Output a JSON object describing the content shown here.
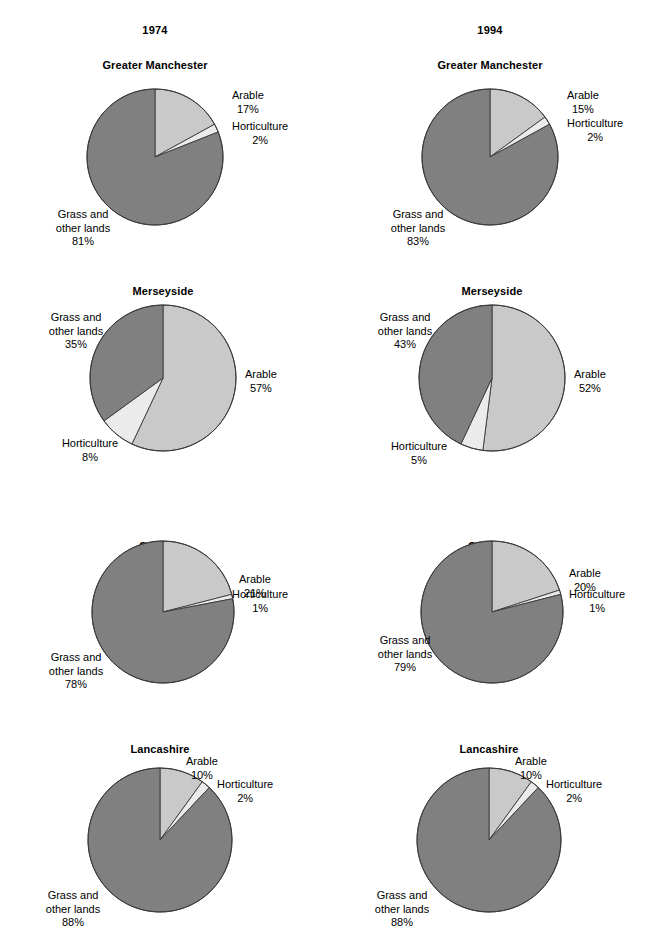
{
  "figure": {
    "columns": [
      {
        "year_label": "1974"
      },
      {
        "year_label": "1994"
      }
    ],
    "legend_colors": {
      "arable": "#c9c9c9",
      "horticulture": "#ebebeb",
      "grass": "#808080",
      "outline": "#3a3a3a"
    },
    "footnote": ""
  },
  "chart_data": {
    "type": "pie",
    "title": "",
    "categories": [
      "Arable",
      "Horticulture",
      "Grass and other lands"
    ],
    "legend": [
      "Arable",
      "Horticulture",
      "Grass and other lands"
    ],
    "colors": [
      "#c9c9c9",
      "#ebebeb",
      "#808080"
    ],
    "units": "%",
    "start_angle_deg": 0,
    "direction": "clockwise",
    "panels": [
      {
        "id": "gm-1974",
        "year": "1974",
        "county": "Greater Manchester",
        "slices": [
          {
            "label": "Arable",
            "value": 17,
            "value_label": "17%"
          },
          {
            "label": "Horticulture",
            "value": 2,
            "value_label": "2%"
          },
          {
            "label": "Grass and other lands",
            "value": 81,
            "value_label": "81%"
          }
        ]
      },
      {
        "id": "gm-1994",
        "year": "1994",
        "county": "Greater Manchester",
        "slices": [
          {
            "label": "Arable",
            "value": 15,
            "value_label": "15%"
          },
          {
            "label": "Horticulture",
            "value": 2,
            "value_label": "2%"
          },
          {
            "label": "Grass and other lands",
            "value": 83,
            "value_label": "83%"
          }
        ]
      },
      {
        "id": "mer-1974",
        "year": "1974",
        "county": "Merseyside",
        "slices": [
          {
            "label": "Arable",
            "value": 57,
            "value_label": "57%"
          },
          {
            "label": "Horticulture",
            "value": 8,
            "value_label": "8%"
          },
          {
            "label": "Grass and other lands",
            "value": 35,
            "value_label": "35%"
          }
        ]
      },
      {
        "id": "mer-1994",
        "year": "1994",
        "county": "Merseyside",
        "slices": [
          {
            "label": "Arable",
            "value": 52,
            "value_label": "52%"
          },
          {
            "label": "Horticulture",
            "value": 5,
            "value_label": "5%"
          },
          {
            "label": "Grass and other lands",
            "value": 43,
            "value_label": "43%"
          }
        ]
      },
      {
        "id": "che-1974",
        "year": "1974",
        "county": "Cheshire",
        "slices": [
          {
            "label": "Arable",
            "value": 21,
            "value_label": "21%"
          },
          {
            "label": "Horticulture",
            "value": 1,
            "value_label": "1%"
          },
          {
            "label": "Grass and other lands",
            "value": 78,
            "value_label": "78%"
          }
        ]
      },
      {
        "id": "che-1994",
        "year": "1994",
        "county": "Cheshire",
        "slices": [
          {
            "label": "Arable",
            "value": 20,
            "value_label": "20%"
          },
          {
            "label": "Horticulture",
            "value": 1,
            "value_label": "1%"
          },
          {
            "label": "Grass and other lands",
            "value": 79,
            "value_label": "79%"
          }
        ]
      },
      {
        "id": "lan-1974",
        "year": "1974",
        "county": "Lancashire",
        "slices": [
          {
            "label": "Arable",
            "value": 10,
            "value_label": "10%"
          },
          {
            "label": "Horticulture",
            "value": 2,
            "value_label": "2%"
          },
          {
            "label": "Grass and other lands",
            "value": 88,
            "value_label": "88%"
          }
        ]
      },
      {
        "id": "lan-1994",
        "year": "1994",
        "county": "Lancashire",
        "slices": [
          {
            "label": "Arable",
            "value": 10,
            "value_label": "10%"
          },
          {
            "label": "Horticulture",
            "value": 2,
            "value_label": "2%"
          },
          {
            "label": "Grass and other lands",
            "value": 88,
            "value_label": "88%"
          }
        ]
      }
    ]
  },
  "layout": {
    "panel_geometry": [
      {
        "cx": 155,
        "cy": 157,
        "r": 68,
        "title_x": 155,
        "title_y": 59,
        "labels": [
          {
            "role": "arable",
            "x": 232,
            "y": 89,
            "align": "l"
          },
          {
            "role": "horticulture",
            "x": 232,
            "y": 120,
            "align": "l"
          },
          {
            "role": "grass",
            "x": 83,
            "y": 208,
            "align": "c"
          }
        ]
      },
      {
        "cx": 490,
        "cy": 157,
        "r": 68,
        "title_x": 490,
        "title_y": 59,
        "labels": [
          {
            "role": "arable",
            "x": 567,
            "y": 89,
            "align": "l"
          },
          {
            "role": "horticulture",
            "x": 567,
            "y": 117,
            "align": "l"
          },
          {
            "role": "grass",
            "x": 418,
            "y": 208,
            "align": "c"
          }
        ]
      },
      {
        "cx": 163,
        "cy": 378,
        "r": 73,
        "title_x": 163,
        "title_y": 285,
        "labels": [
          {
            "role": "arable",
            "x": 245,
            "y": 368,
            "align": "l"
          },
          {
            "role": "horticulture",
            "x": 90,
            "y": 437,
            "align": "c"
          },
          {
            "role": "grass",
            "x": 76,
            "y": 311,
            "align": "c"
          }
        ]
      },
      {
        "cx": 492,
        "cy": 378,
        "r": 73,
        "title_x": 492,
        "title_y": 285,
        "labels": [
          {
            "role": "arable",
            "x": 574,
            "y": 368,
            "align": "l"
          },
          {
            "role": "horticulture",
            "x": 419,
            "y": 440,
            "align": "c"
          },
          {
            "role": "grass",
            "x": 405,
            "y": 311,
            "align": "c"
          }
        ]
      },
      {
        "cx": 163,
        "cy": 612,
        "r": 71,
        "title_x": 163,
        "title_y": 540,
        "labels": [
          {
            "role": "arable",
            "x": 239,
            "y": 573,
            "align": "l"
          },
          {
            "role": "horticulture",
            "x": 232,
            "y": 588,
            "align": "l"
          },
          {
            "role": "grass",
            "x": 76,
            "y": 651,
            "align": "c"
          }
        ]
      },
      {
        "cx": 492,
        "cy": 612,
        "r": 71,
        "title_x": 492,
        "title_y": 540,
        "labels": [
          {
            "role": "arable",
            "x": 569,
            "y": 567,
            "align": "l"
          },
          {
            "role": "horticulture",
            "x": 569,
            "y": 588,
            "align": "l"
          },
          {
            "role": "grass",
            "x": 405,
            "y": 634,
            "align": "c"
          }
        ]
      },
      {
        "cx": 160,
        "cy": 840,
        "r": 72,
        "title_x": 160,
        "title_y": 743,
        "labels": [
          {
            "role": "arable",
            "x": 186,
            "y": 755,
            "align": "l"
          },
          {
            "role": "horticulture",
            "x": 217,
            "y": 778,
            "align": "l"
          },
          {
            "role": "grass",
            "x": 73,
            "y": 889,
            "align": "c"
          }
        ]
      },
      {
        "cx": 489,
        "cy": 840,
        "r": 72,
        "title_x": 489,
        "title_y": 743,
        "labels": [
          {
            "role": "arable",
            "x": 515,
            "y": 755,
            "align": "l"
          },
          {
            "role": "horticulture",
            "x": 546,
            "y": 778,
            "align": "l"
          },
          {
            "role": "grass",
            "x": 402,
            "y": 889,
            "align": "c"
          }
        ]
      }
    ],
    "year_positions": [
      {
        "x": 155,
        "y": 24
      },
      {
        "x": 490,
        "y": 24
      }
    ]
  }
}
